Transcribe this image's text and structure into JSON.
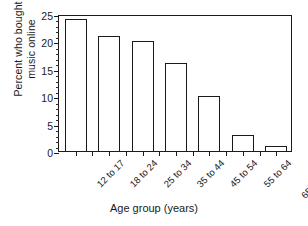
{
  "chart_data": {
    "type": "bar",
    "title": "",
    "xlabel": "Age group (years)",
    "ylabel_line1": "Percent who bought",
    "ylabel_line2": "music online",
    "categories": [
      "12 to 17",
      "18 to 24",
      "25 to 34",
      "35 to 44",
      "45 to 54",
      "55 to 64",
      "65 and over"
    ],
    "values": [
      24,
      21,
      20,
      16,
      10,
      3,
      1
    ],
    "ylim": [
      0,
      25
    ],
    "ytick_labels": [
      "0",
      "5",
      "10",
      "15",
      "20",
      "25"
    ],
    "ytick_values": [
      0,
      5,
      10,
      15,
      20,
      25
    ],
    "yminor_step": 1,
    "grid": false,
    "legend": null,
    "bar_fill_color": "#ffffff",
    "bar_edge_color": "#1a1a1a",
    "background_color": "#ffffff",
    "axis_color": "#1a1a1a"
  }
}
